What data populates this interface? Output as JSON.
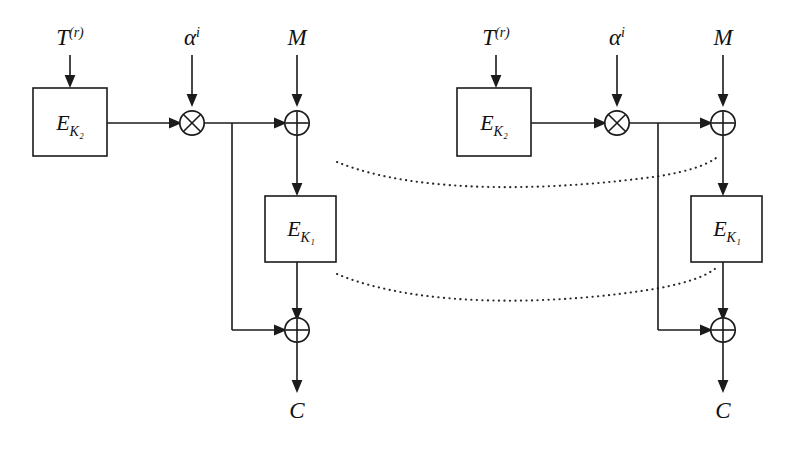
{
  "figure": {
    "background_color": "#ffffff",
    "line_color": "#1b1b1b",
    "dotted_color": "#2a2a2a"
  },
  "labels": {
    "tweak": "T",
    "tweak_sup": "(r)",
    "alpha": "α",
    "alpha_sup": "i",
    "message": "M",
    "ciphertext": "C",
    "enc_outer": "E",
    "enc_outer_sub": "K₂",
    "enc_inner": "E",
    "enc_inner_sub": "K₁"
  },
  "operators": {
    "multiply": "⊗",
    "xor": "⊕"
  },
  "stages": [
    {
      "name": "stage-left",
      "inputs": [
        "T",
        "α",
        "M"
      ],
      "blocks": [
        "E_K2",
        "E_K1"
      ],
      "operators": [
        "⊗",
        "⊕",
        "⊕"
      ],
      "output": "C"
    },
    {
      "name": "stage-right",
      "inputs": [
        "T",
        "α",
        "M"
      ],
      "blocks": [
        "E_K2",
        "E_K1"
      ],
      "operators": [
        "⊗",
        "⊕",
        "⊕"
      ],
      "output": "C"
    }
  ],
  "ellipsis": {
    "count": 2,
    "style": "dotted-curve",
    "meaning": "repeated intermediate stages omitted"
  }
}
